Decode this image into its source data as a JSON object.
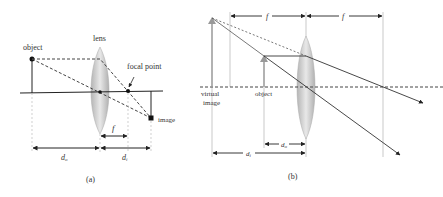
{
  "figure": {
    "panel_a": {
      "caption": "(a)",
      "labels": {
        "object": "object",
        "lens": "lens",
        "focal_point": "focal point",
        "image": "image",
        "f": "f",
        "d_o": "d",
        "d_o_sub": "o",
        "d_i": "d",
        "d_i_sub": "i"
      }
    },
    "panel_b": {
      "caption": "(b)",
      "labels": {
        "virtual_image_line1": "virtual",
        "virtual_image_line2": "image",
        "object": "object",
        "f_left": "f",
        "f_right": "f",
        "d_o": "d",
        "d_o_sub": "o",
        "d_i": "d",
        "d_i_sub": "i"
      }
    }
  },
  "colors": {
    "line": "#222222",
    "dashed": "#444444",
    "guide": "#bbbbbb",
    "lens_fill": "#c8c8c8",
    "arrow_gray": "#999999"
  }
}
